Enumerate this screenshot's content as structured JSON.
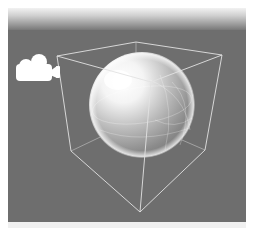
{
  "window": {
    "caption_partial": ""
  },
  "viewport": {
    "background_color": "#6e6e6e",
    "header_gradient": [
      "#f2f2f2",
      "#9a9a9a",
      "#787878"
    ],
    "objects": [
      {
        "type": "camera-gizmo",
        "icon": "camera-icon",
        "color": "#ffffff"
      },
      {
        "type": "sphere",
        "shading": "glossy-white"
      },
      {
        "type": "bounding-box",
        "style": "wireframe",
        "line_color": "#d9d9d9"
      }
    ]
  }
}
